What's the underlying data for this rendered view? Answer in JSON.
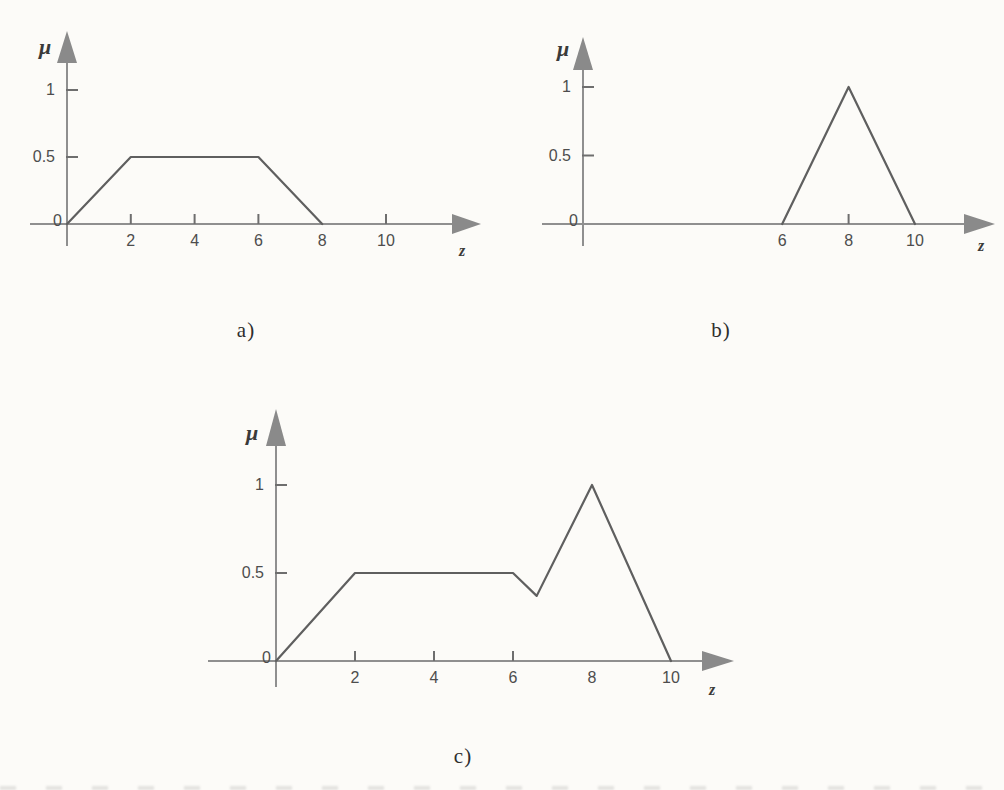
{
  "page": {
    "background_color": "#fcfbf8"
  },
  "styles": {
    "axis_color": "#8f8f8f",
    "arrow_color": "#8a8a8a",
    "tick_color": "#6e6e6e",
    "curve_color": "#5f5f5f",
    "tick_label_color": "#4d4d4d",
    "axis_label_color": "#3a3a3a",
    "caption_color": "#2e2e2e"
  },
  "chart_data": [
    {
      "id": "a",
      "type": "line",
      "caption": "a)",
      "xlabel": "z",
      "ylabel": "μ",
      "grid": false,
      "xlim": [
        0,
        12
      ],
      "ylim": [
        0,
        1.4
      ],
      "x_tick_labels": [
        2,
        4,
        6,
        8,
        10
      ],
      "x_tick_marks": [
        2,
        4,
        6,
        10
      ],
      "y_tick_labels": [
        0,
        0.5,
        1
      ],
      "y_tick_marks": [
        0.5,
        1
      ],
      "points": [
        [
          0,
          0
        ],
        [
          2,
          0.5
        ],
        [
          6,
          0.5
        ],
        [
          8,
          0
        ]
      ]
    },
    {
      "id": "b",
      "type": "line",
      "caption": "b)",
      "xlabel": "z",
      "ylabel": "μ",
      "grid": false,
      "xlim": [
        0,
        12
      ],
      "ylim": [
        0,
        1.4
      ],
      "x_tick_labels": [
        6,
        8,
        10
      ],
      "x_tick_marks": [
        8
      ],
      "y_tick_labels": [
        0,
        0.5,
        1
      ],
      "y_tick_marks": [
        0.5,
        1
      ],
      "points": [
        [
          6,
          0
        ],
        [
          8,
          1
        ],
        [
          10,
          0
        ]
      ]
    },
    {
      "id": "c",
      "type": "line",
      "caption": "c)",
      "xlabel": "z",
      "ylabel": "μ",
      "grid": false,
      "xlim": [
        0,
        11.6
      ],
      "ylim": [
        0,
        1.4
      ],
      "x_tick_labels": [
        2,
        4,
        6,
        8,
        10
      ],
      "x_tick_marks": [
        2,
        4,
        6
      ],
      "y_tick_labels": [
        0,
        0.5,
        1
      ],
      "y_tick_marks": [
        0.5,
        1
      ],
      "points": [
        [
          0,
          0
        ],
        [
          2,
          0.5
        ],
        [
          6,
          0.5
        ],
        [
          6.6,
          0.37
        ],
        [
          8,
          1
        ],
        [
          10,
          0
        ]
      ]
    }
  ]
}
